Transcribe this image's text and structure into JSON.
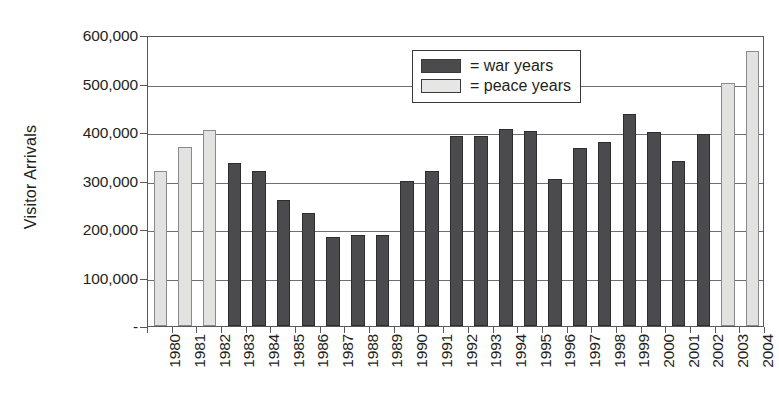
{
  "chart_data": {
    "type": "bar",
    "title": "",
    "xlabel": "",
    "ylabel": "Visitor Arrivals",
    "ylim": [
      0,
      600000
    ],
    "ytick_labels": [
      "600,000",
      "500,000",
      "400,000",
      "300,000",
      "200,000",
      "100,000",
      "-"
    ],
    "ytick_values": [
      600000,
      500000,
      400000,
      300000,
      200000,
      100000,
      0
    ],
    "grid": true,
    "legend_position": "inside-top-right",
    "categories": [
      "1980",
      "1981",
      "1982",
      "1983",
      "1984",
      "1985",
      "1986",
      "1987",
      "1988",
      "1989",
      "1990",
      "1991",
      "1992",
      "1993",
      "1994",
      "1995",
      "1996",
      "1997",
      "1998",
      "1999",
      "2000",
      "2001",
      "2002",
      "2003",
      "2004"
    ],
    "values": [
      320000,
      370000,
      405000,
      337000,
      320000,
      260000,
      233000,
      183000,
      187000,
      188000,
      300000,
      320000,
      392000,
      392000,
      407000,
      402000,
      303000,
      367000,
      380000,
      437000,
      400000,
      340000,
      395000,
      502000,
      567000
    ],
    "groups": [
      "peace",
      "peace",
      "peace",
      "war",
      "war",
      "war",
      "war",
      "war",
      "war",
      "war",
      "war",
      "war",
      "war",
      "war",
      "war",
      "war",
      "war",
      "war",
      "war",
      "war",
      "war",
      "war",
      "war",
      "peace",
      "peace"
    ],
    "series": [
      {
        "name": "war years",
        "color": "#4b4b4d"
      },
      {
        "name": "peace years",
        "color": "#e2e2e0"
      }
    ],
    "legend": [
      {
        "marker": "war",
        "label": "= war years"
      },
      {
        "marker": "peace",
        "label": "= peace years"
      }
    ]
  }
}
